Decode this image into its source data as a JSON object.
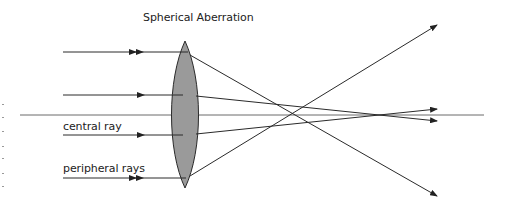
{
  "figure": {
    "title": "Spherical Aberration",
    "labels": {
      "central": "central ray",
      "peripheral": "peripheral rays"
    },
    "colors": {
      "lens_fill": "#9a9a9a",
      "line": "#2a2a2a",
      "axis": "#6a6a6a"
    }
  }
}
